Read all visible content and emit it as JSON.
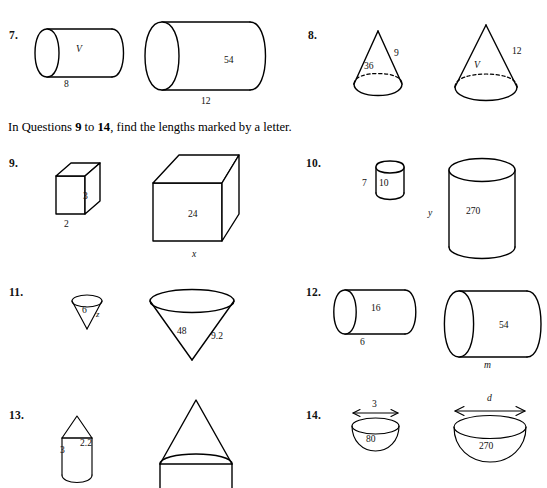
{
  "page": {
    "width": 547,
    "height": 486,
    "background": "#ffffff",
    "ink": "#000000"
  },
  "instruction": {
    "prefix": "In Questions ",
    "first": "9",
    "middle": " to ",
    "last": "14",
    "suffix": ", find the lengths marked by a letter."
  },
  "questions": [
    {
      "number": "7.",
      "shape": "cylinder-pair",
      "small": {
        "body_label": "V",
        "base_label": "8"
      },
      "large": {
        "body_label": "54",
        "base_label": "12"
      }
    },
    {
      "number": "8.",
      "shape": "cone-pair",
      "small": {
        "body_label": "36",
        "slant_label": "9"
      },
      "large": {
        "body_label": "V",
        "slant_label": "12"
      }
    },
    {
      "number": "9.",
      "shape": "cube-pair",
      "small": {
        "face_label": "3",
        "base_label": "2"
      },
      "large": {
        "face_label": "24",
        "base_label": "x"
      }
    },
    {
      "number": "10.",
      "shape": "cylinder-upright-pair",
      "small": {
        "height_label": "7",
        "body_label": "10"
      },
      "large": {
        "height_label": "y",
        "body_label": "270"
      }
    },
    {
      "number": "11.",
      "shape": "inverted-cone-pair",
      "small": {
        "body_label": "6",
        "slant_label": "z"
      },
      "large": {
        "body_label": "48",
        "slant_label": "9.2"
      }
    },
    {
      "number": "12.",
      "shape": "cylinder-pair",
      "small": {
        "body_label": "16",
        "base_label": "6"
      },
      "large": {
        "body_label": "54",
        "base_label": "m"
      }
    },
    {
      "number": "13.",
      "shape": "cone-on-cylinder-pair",
      "small": {
        "body_label": "3",
        "side_label": "2.2"
      },
      "large": {
        "body_label": "",
        "side_label": ""
      }
    },
    {
      "number": "14.",
      "shape": "hemisphere-bowl-pair",
      "small": {
        "width_label": "3",
        "body_label": "80"
      },
      "large": {
        "width_label": "d",
        "body_label": "270"
      }
    }
  ]
}
